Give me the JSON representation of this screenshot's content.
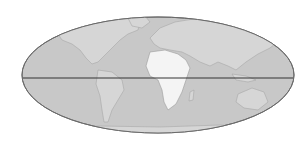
{
  "map": {
    "projection": "elliptical world map",
    "highlighted_region": "Africa",
    "colors": {
      "background": "#ffffff",
      "ocean": "#c8c8c8",
      "land": "#d9d9d9",
      "highlight": "#f4f4f4",
      "outline": "#6a6a6a",
      "equator": "#333333"
    },
    "features": [
      "equator-line",
      "continents",
      "highlighted-africa"
    ]
  }
}
